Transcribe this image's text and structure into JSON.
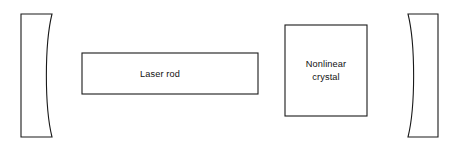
{
  "figure": {
    "kind": "optical-cavity-schematic",
    "background_color": "#ffffff",
    "line_color": "#1a1a1a",
    "width": 459,
    "height": 147
  },
  "components": {
    "laser_rod": {
      "label": "Laser rod",
      "shape": "rectangle",
      "x": 82,
      "y": 53,
      "width": 176,
      "height": 41
    },
    "nonlinear_crystal": {
      "label_line1": "Nonlinear",
      "label_line2": "crystal",
      "shape": "rectangle",
      "x": 285,
      "y": 25,
      "width": 82,
      "height": 91
    },
    "left_mirror": {
      "label": "",
      "shape": "concave-mirror",
      "x": 21,
      "y": 14,
      "width": 31,
      "height": 123,
      "curve_depth": 9,
      "curve_side": "right"
    },
    "right_mirror": {
      "label": "",
      "shape": "concave-mirror",
      "x": 408,
      "y": 14,
      "width": 30,
      "height": 123,
      "curve_depth": 9,
      "curve_side": "left"
    }
  }
}
